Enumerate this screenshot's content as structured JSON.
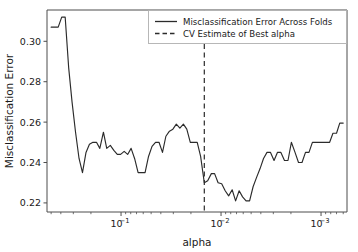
{
  "chart_data": {
    "type": "line",
    "title": "",
    "xlabel": "alpha",
    "ylabel": "Misclassification Error",
    "x_scale": "log",
    "x_inverted": true,
    "xlim": [
      0.55,
      0.00055
    ],
    "ylim": [
      0.2155,
      0.3155
    ],
    "grid": false,
    "legend_position": "upper right",
    "y_ticks": [
      0.22,
      0.24,
      0.26,
      0.28,
      0.3
    ],
    "y_tick_labels": [
      "0.22",
      "0.24",
      "0.26",
      "0.28",
      "0.30"
    ],
    "x_ticks": [
      0.1,
      0.01,
      0.001
    ],
    "x_tick_labels": [
      "10−1",
      "10−2",
      "10−3"
    ],
    "x_tick_mantissa": "10",
    "x_tick_exponents": [
      "−1",
      "−2",
      "−3"
    ],
    "series": [
      {
        "name": "Misclassification Error Across Folds",
        "style": "solid",
        "color": "#2b2b2b",
        "x": [
          0.5,
          0.46,
          0.425,
          0.392,
          0.362,
          0.334,
          0.309,
          0.285,
          0.263,
          0.243,
          0.224,
          0.207,
          0.191,
          0.176,
          0.163,
          0.15,
          0.139,
          0.128,
          0.118,
          0.109,
          0.101,
          0.093,
          0.0859,
          0.0793,
          0.0732,
          0.0675,
          0.0623,
          0.0575,
          0.0531,
          0.049,
          0.0452,
          0.0417,
          0.0385,
          0.0356,
          0.0328,
          0.0303,
          0.028,
          0.0258,
          0.0238,
          0.022,
          0.0203,
          0.0187,
          0.0173,
          0.016,
          0.0147,
          0.0136,
          0.0125,
          0.0116,
          0.0107,
          0.00985,
          0.00909,
          0.00839,
          0.00774,
          0.00715,
          0.00659,
          0.00609,
          0.00562,
          0.00518,
          0.00478,
          0.00442,
          0.00407,
          0.00376,
          0.00347,
          0.0032,
          0.00295,
          0.00273,
          0.00252,
          0.00232,
          0.00214,
          0.00198,
          0.00182,
          0.00168,
          0.00155,
          0.00143,
          0.00132,
          0.00122,
          0.00113,
          0.00104,
          0.00096,
          0.00089,
          0.00082,
          0.00076,
          0.0007,
          0.00065,
          0.0006
        ],
        "values": [
          0.307,
          0.307,
          0.307,
          0.312,
          0.312,
          0.287,
          0.27,
          0.255,
          0.242,
          0.235,
          0.245,
          0.249,
          0.25,
          0.25,
          0.247,
          0.255,
          0.247,
          0.2485,
          0.246,
          0.244,
          0.244,
          0.2455,
          0.244,
          0.247,
          0.242,
          0.235,
          0.235,
          0.235,
          0.243,
          0.248,
          0.25,
          0.25,
          0.245,
          0.253,
          0.2555,
          0.2565,
          0.259,
          0.257,
          0.259,
          0.2565,
          0.25,
          0.25,
          0.25,
          0.243,
          0.23,
          0.231,
          0.2345,
          0.2345,
          0.23,
          0.2295,
          0.226,
          0.2235,
          0.2265,
          0.221,
          0.226,
          0.223,
          0.221,
          0.221,
          0.228,
          0.2325,
          0.237,
          0.242,
          0.245,
          0.245,
          0.241,
          0.245,
          0.245,
          0.241,
          0.241,
          0.25,
          0.245,
          0.24,
          0.24,
          0.245,
          0.245,
          0.25,
          0.25,
          0.25,
          0.25,
          0.25,
          0.25,
          0.2545,
          0.2545,
          0.2595,
          0.2595
        ]
      }
    ],
    "vline": {
      "name": "CV Estimate of Best alpha",
      "style": "dashed",
      "color": "#2b2b2b",
      "x": 0.0147
    },
    "legend_entries": [
      {
        "label": "Misclassification Error Across Folds",
        "style": "solid"
      },
      {
        "label": "CV Estimate of Best alpha",
        "style": "dashed"
      }
    ]
  }
}
